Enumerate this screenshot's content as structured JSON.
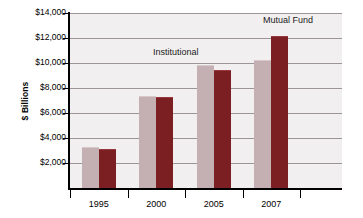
{
  "chart_data": {
    "type": "bar",
    "title": "",
    "subtitle": "",
    "xlabel": "",
    "ylabel": "$ Billions",
    "categories": [
      "1995",
      "2000",
      "2005",
      "2007"
    ],
    "series": [
      {
        "name": "Institutional",
        "color": "#c4b0b2",
        "values": [
          3200,
          7250,
          9750,
          10200
        ]
      },
      {
        "name": "Mutual Fund",
        "color": "#7b1f23",
        "values": [
          3050,
          7200,
          9400,
          12050
        ]
      }
    ],
    "ylim": [
      0,
      14000
    ],
    "y_ticks": [
      2000,
      4000,
      6000,
      8000,
      10000,
      12000,
      14000
    ],
    "y_tick_labels": [
      "$2,000",
      "$4,000",
      "$6,000",
      "$8,000",
      "$10,000",
      "$12,000",
      "$14,000"
    ],
    "grid": true,
    "legend": "inline-annotations",
    "annotations": [
      {
        "text": "Institutional",
        "series": "Institutional"
      },
      {
        "text": "Mutual Fund",
        "series": "Mutual Fund"
      }
    ],
    "plot_background": "#f2eff0",
    "gridline_color": "#9c9497",
    "axis_color": "#000000"
  }
}
